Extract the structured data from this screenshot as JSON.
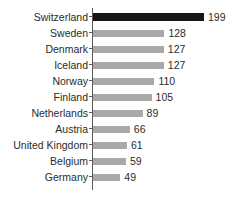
{
  "chart_data": {
    "type": "bar",
    "orientation": "horizontal",
    "title": "",
    "subtitle": "",
    "xlabel": "",
    "ylabel": "",
    "xlim": [
      0,
      199
    ],
    "grid": false,
    "legend": null,
    "categories": [
      "Switzerland",
      "Sweden",
      "Denmark",
      "Iceland",
      "Norway",
      "Finland",
      "Netherlands",
      "Austria",
      "United Kingdom",
      "Belgium",
      "Germany"
    ],
    "values": [
      199,
      128,
      127,
      127,
      110,
      105,
      89,
      66,
      61,
      59,
      49
    ],
    "value_labels": [
      "199",
      "128",
      "127",
      "127",
      "110",
      "105",
      "89",
      "66",
      "61",
      "59",
      "49"
    ],
    "highlight_index": 0,
    "colors": {
      "bar": "#a9a9a9",
      "bar_highlight": "#161616",
      "axis": "#5a5a5a",
      "text": "#2b2b2b",
      "background": "#ffffff"
    },
    "px_per_unit": 0.5578
  }
}
